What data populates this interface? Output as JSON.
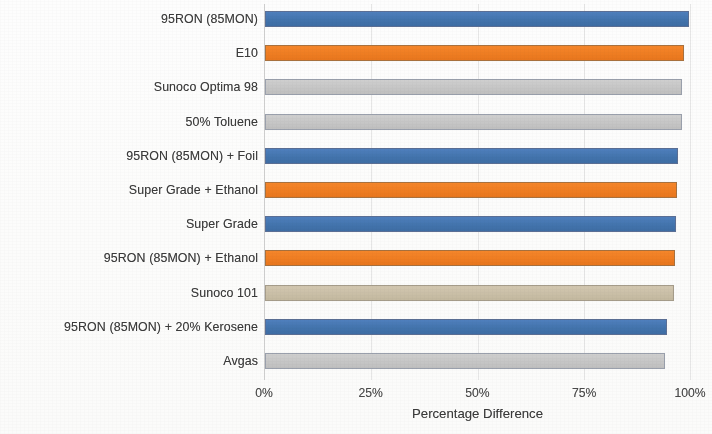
{
  "chart_data": {
    "type": "bar",
    "orientation": "horizontal",
    "title": "",
    "xlabel": "Percentage Difference",
    "ylabel": "",
    "xlim": [
      0,
      100
    ],
    "xticks": [
      "0%",
      "25%",
      "50%",
      "75%",
      "100%"
    ],
    "xtick_values": [
      0,
      25,
      50,
      75,
      100
    ],
    "grid": true,
    "legend": "none",
    "categories": [
      "95RON (85MON)",
      "E10",
      "Sunoco Optima 98",
      "50% Toluene",
      "95RON (85MON) + Foil",
      "Super Grade + Ethanol",
      "Super Grade",
      "95RON (85MON) + Ethanol",
      "Sunoco 101",
      "95RON (85MON)  + 20% Kerosene",
      "Avgas"
    ],
    "values": [
      99.5,
      98.4,
      97.9,
      97.8,
      97.0,
      96.7,
      96.5,
      96.3,
      96.0,
      94.3,
      93.8
    ],
    "bar_colors": [
      "#4374ad",
      "#ef7d22",
      "#c6c6c6",
      "#c6c6c6",
      "#4374ad",
      "#ef7d22",
      "#4374ad",
      "#ef7d22",
      "#cabfa7",
      "#4374ad",
      "#c6c6c6"
    ],
    "color_names": [
      "blue",
      "orange",
      "gray",
      "gray",
      "blue",
      "orange",
      "blue",
      "orange",
      "tan",
      "blue",
      "gray"
    ]
  },
  "palette": {
    "blue": "#4374ad",
    "orange": "#ef7d22",
    "gray": "#c6c6c6",
    "tan": "#cabfa7",
    "gridline": "#e6e6e6",
    "text": "#3b3b3b",
    "background": "#ffffff"
  }
}
